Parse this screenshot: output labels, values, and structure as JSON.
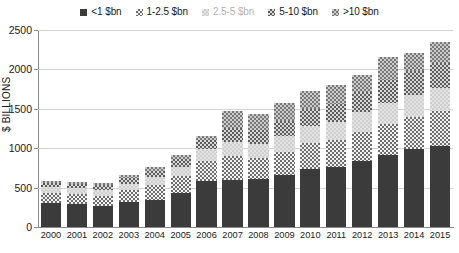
{
  "chart_data": {
    "type": "bar",
    "subtype": "stacked-vertical",
    "title": "",
    "xlabel": "",
    "ylabel": "$ BILLIONS",
    "ylim": [
      0,
      2500
    ],
    "yticks": [
      0,
      500,
      1000,
      1500,
      2000,
      2500
    ],
    "grid": true,
    "legend_position": "top-center",
    "categories": [
      "2000",
      "2001",
      "2002",
      "2003",
      "2004",
      "2005",
      "2006",
      "2007",
      "2008",
      "2009",
      "2010",
      "2011",
      "2012",
      "2013",
      "2014",
      "2015"
    ],
    "series": [
      {
        "name": "<1 $bn",
        "color": "#3b3b3b",
        "pattern": "solid",
        "values": [
          300,
          290,
          265,
          320,
          345,
          430,
          590,
          600,
          605,
          655,
          740,
          760,
          835,
          910,
          985,
          1030
        ]
      },
      {
        "name": "1-2.5 $bn",
        "color": "#8c8c8c",
        "pattern": "checker-dark",
        "values": [
          130,
          135,
          135,
          150,
          185,
          215,
          250,
          300,
          270,
          300,
          330,
          345,
          375,
          400,
          415,
          440
        ]
      },
      {
        "name": "2.5-5 $bn",
        "color": "#cfcfcf",
        "pattern": "light",
        "values": [
          75,
          70,
          75,
          80,
          100,
          120,
          150,
          180,
          175,
          195,
          215,
          225,
          250,
          265,
          280,
          295
        ]
      },
      {
        "name": "5-10 $bn",
        "color": "#7a7a7a",
        "pattern": "checker-mid",
        "values": [
          55,
          55,
          60,
          70,
          85,
          95,
          115,
          175,
          180,
          195,
          215,
          230,
          250,
          290,
          300,
          315
        ]
      },
      {
        "name": ">10 $bn",
        "color": "#9a9a9a",
        "pattern": "checker-lite",
        "values": [
          20,
          25,
          30,
          35,
          45,
          50,
          55,
          215,
          205,
          225,
          230,
          240,
          220,
          295,
          225,
          265
        ]
      }
    ],
    "totals": [
      580,
      575,
      565,
      655,
      760,
      910,
      1160,
      1470,
      1435,
      1570,
      1730,
      1800,
      1930,
      2160,
      2205,
      2345
    ],
    "legend": [
      {
        "label": "<1 $bn",
        "swatch": "swatch-solid",
        "text_color": "#1a1a1a"
      },
      {
        "label": "1-2.5 $bn",
        "swatch": "swatch-checker-dark",
        "text_color": "#1a1a1a"
      },
      {
        "label": "2.5-5 $bn",
        "swatch": "swatch-light",
        "text_color": "#b4b4b4"
      },
      {
        "label": "5-10 $bn",
        "swatch": "swatch-checker-mid",
        "text_color": "#1a1a1a"
      },
      {
        "label": ">10 $bn",
        "swatch": "swatch-checker-lite",
        "text_color": "#1a1a1a"
      }
    ]
  }
}
